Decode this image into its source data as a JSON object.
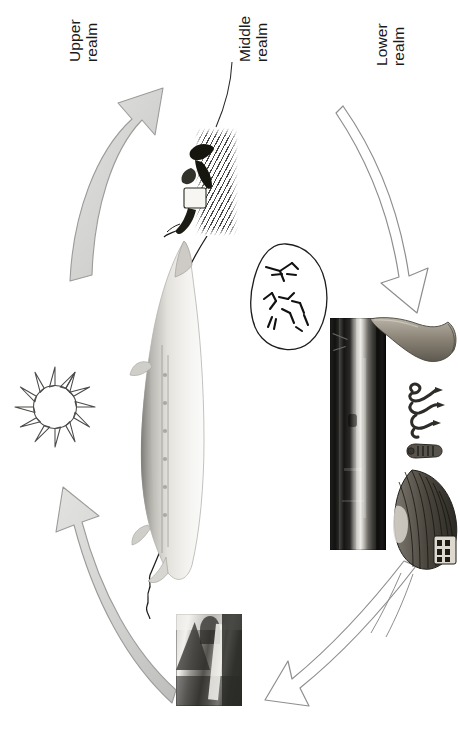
{
  "diagram": {
    "orientation": "rotated-90-ccw",
    "background_color": "#ffffff",
    "ink_color": "#1a1a1a",
    "arrow_fill_color": "#d4d4d2",
    "arrow_stroke_color": "#8c8c8a"
  },
  "labels": [
    {
      "id": "upper",
      "line1": "Upper",
      "line2": "realm"
    },
    {
      "id": "middle",
      "line1": "Middle",
      "line2": "realm"
    },
    {
      "id": "lower",
      "line1": "Lower",
      "line2": "realm"
    }
  ],
  "arrows": [
    {
      "id": "upper-left-arrow",
      "style": "filled-grey",
      "direction": "up-right",
      "from": "middle-realm",
      "to": "upper-realm"
    },
    {
      "id": "lower-left-arrow",
      "style": "filled-grey",
      "direction": "up-left",
      "from": "lower-realm",
      "to": "upper-realm"
    },
    {
      "id": "upper-right-arrow",
      "style": "outline",
      "direction": "down-right",
      "from": "upper-realm",
      "to": "lower-realm"
    },
    {
      "id": "lower-right-arrow",
      "style": "outline",
      "direction": "down-left",
      "from": "lower-realm",
      "to": "middle-realm"
    }
  ],
  "figures": [
    {
      "id": "sun",
      "caption": "sun symbol",
      "realm": "upper"
    },
    {
      "id": "sturgeon",
      "caption": "sturgeon figure",
      "realm": "middle"
    },
    {
      "id": "engraving",
      "caption": "elk engraving in vegetation",
      "realm": "middle"
    },
    {
      "id": "petroglyph",
      "caption": "rock-art panel with stick figures",
      "realm": "middle"
    },
    {
      "id": "river-photo",
      "caption": "dark river photograph",
      "realm": "lower"
    },
    {
      "id": "landscape-photo",
      "caption": "mountain landscape photograph",
      "realm": "upper"
    },
    {
      "id": "axe",
      "caption": "axe head artifact",
      "realm": "lower"
    },
    {
      "id": "serpent",
      "caption": "serpent figure artifact",
      "realm": "lower"
    },
    {
      "id": "figurine",
      "caption": "small figurine artifact",
      "realm": "lower"
    },
    {
      "id": "fanshell",
      "caption": "ribbed fan-shaped artifact",
      "realm": "lower"
    }
  ],
  "connectors": [
    {
      "id": "middle-label-leader",
      "from": "middle-realm-label",
      "to": "engraving"
    },
    {
      "id": "sturgeon-head-leader",
      "from": "engraving",
      "to": "sturgeon-head"
    },
    {
      "id": "sturgeon-tail-leader",
      "from": "sturgeon-tail",
      "to": "landscape-photo"
    },
    {
      "id": "fanshell-leader",
      "from": "fanshell",
      "to": "lower-right-arrow"
    }
  ]
}
